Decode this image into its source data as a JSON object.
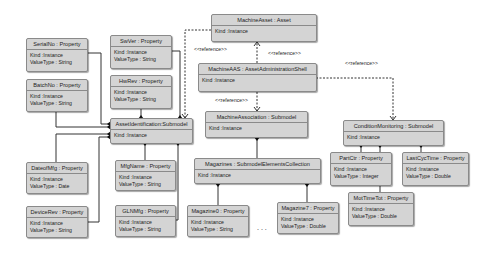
{
  "diagram": {
    "nodes": {
      "machine_asset": {
        "title": "MachineAsset : Asset",
        "kind": "Kind :Instance"
      },
      "machine_aas": {
        "title": "MachineAAS : AssetAdministrationShell",
        "kind": "Kind :Instance"
      },
      "asset_identification": {
        "title": "AssetIdentification:Submodel",
        "kind": "Kind :Instance"
      },
      "machine_association": {
        "title": "MachineAssociation : Submodel",
        "kind": "Kind :Instance"
      },
      "condition_monitoring": {
        "title": "ConditionMonitoring : Submodel",
        "kind": "Kind :Instance"
      },
      "magazines": {
        "title": "Magazines : SubmodelElementsCollection",
        "kind": "Kind :Instance"
      },
      "serial_no": {
        "title": "SerialNo : Property",
        "kind": "Kind :Instance",
        "value_type": "ValueType : String"
      },
      "sw_ver": {
        "title": "SwVer : Property",
        "kind": "Kind :Instance",
        "value_type": "ValueType : String"
      },
      "batch_no": {
        "title": "BatchNo : Property",
        "kind": "Kind :Instance",
        "value_type": "ValueType : String"
      },
      "hw_rev": {
        "title": "HwRev : Property",
        "kind": "Kind :Instance",
        "value_type": "ValueType : String"
      },
      "date_of_mfg": {
        "title": "DateofMfg : Property",
        "kind": "Kind :Instance",
        "value_type": "ValueType : Date"
      },
      "device_rev": {
        "title": "DeviceRev : Property",
        "kind": "Kind :Instance",
        "value_type": "ValueType : String"
      },
      "mfg_name": {
        "title": "MfgName : Property",
        "kind": "Kind :Instance",
        "value_type": "ValueType : String"
      },
      "gln_mfg": {
        "title": "GLNMfg : Property",
        "kind": "Kind :Instance",
        "value_type": "ValueType : String"
      },
      "magazine0": {
        "title": "Magazine0 : Property",
        "kind": "Kind :Instance",
        "value_type": "ValueType : String"
      },
      "magazine7": {
        "title": "Magazine7 : Property",
        "kind": "Kind :Instance",
        "value_type": "ValueType : Double"
      },
      "part_ctr": {
        "title": "PartCtr : Property",
        "kind": "Kind :Instance",
        "value_type": "ValueType : Integer"
      },
      "last_cyc_time": {
        "title": "LastCycTime : Property",
        "kind": "Kind :Instance",
        "value_type": "ValueType : Double"
      },
      "mot_time_tot": {
        "title": "MotTimeTot : Property",
        "kind": "Kind :Instance",
        "value_type": "ValueType : Double"
      }
    },
    "labels": {
      "ref1": "<<reference>>",
      "ref2": "<<reference>>",
      "ref3": "<<reference>>",
      "ref4": "<<reference>>",
      "ellipsis": ". . ."
    }
  }
}
